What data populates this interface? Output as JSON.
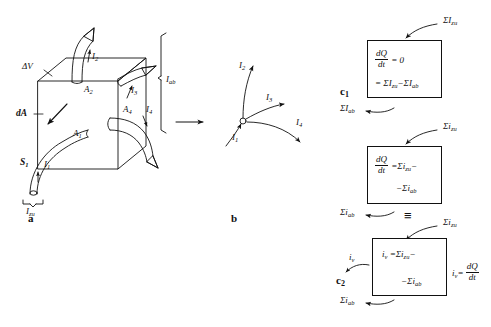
{
  "figure": {
    "parts": [
      {
        "key": "a",
        "label": "a"
      },
      {
        "key": "b",
        "label": "b"
      },
      {
        "key": "c1",
        "label": "c",
        "sub": "1"
      },
      {
        "key": "c2",
        "label": "c",
        "sub": "2"
      }
    ]
  },
  "part_a": {
    "volume_label": {
      "text": "ΔV"
    },
    "area_element_label": {
      "text": "dA"
    },
    "surface_label": {
      "base": "S",
      "sub": "1"
    },
    "areas": [
      {
        "base": "A",
        "sub": "1"
      },
      {
        "base": "A",
        "sub": "2"
      },
      {
        "base": "A",
        "sub": "4"
      }
    ],
    "currents": [
      {
        "base": "I",
        "sub": "1",
        "direction": "in"
      },
      {
        "base": "I",
        "sub": "2",
        "direction": "out"
      },
      {
        "base": "I",
        "sub": "3",
        "direction": "out"
      },
      {
        "base": "I",
        "sub": "4",
        "direction": "out"
      }
    ],
    "brackets": [
      {
        "base": "I",
        "sub": "ab",
        "orientation": "vertical-right"
      },
      {
        "base": "I",
        "sub": "zu",
        "orientation": "horizontal-bottom"
      }
    ]
  },
  "part_b": {
    "node_currents": [
      {
        "base": "I",
        "sub": "1",
        "direction": "in"
      },
      {
        "base": "I",
        "sub": "2",
        "direction": "out"
      },
      {
        "base": "I",
        "sub": "3",
        "direction": "out"
      },
      {
        "base": "I",
        "sub": "4",
        "direction": "out"
      }
    ],
    "transition_arrow": "→"
  },
  "part_c1": {
    "caption": {
      "base": "c",
      "sub": "1"
    },
    "inflow_arrow_label": {
      "sigma": "Σ",
      "base": "I",
      "sub": "zu"
    },
    "outflow_arrow_label": {
      "sigma": "Σ",
      "base": "I",
      "sub": "ab"
    },
    "equation_line1": {
      "frac_num": "dQ",
      "frac_den": "dt",
      "rhs": "= 0"
    },
    "equation_line2": {
      "text": "= ΣI zu − ΣI ab",
      "parts": [
        {
          "op": "="
        },
        {
          "sigma": "Σ",
          "base": "I",
          "sub": "zu"
        },
        {
          "op": "−"
        },
        {
          "sigma": "Σ",
          "base": "I",
          "sub": "ab"
        }
      ]
    }
  },
  "part_c_middle": {
    "inflow_arrow_label": {
      "sigma": "Σ",
      "base": "i",
      "sub": "zu"
    },
    "outflow_arrow_label": {
      "sigma": "Σ",
      "base": "i",
      "sub": "ab"
    },
    "equation_line1": {
      "frac_num": "dQ",
      "frac_den": "dt",
      "rhs_op": "=",
      "sigma": "Σ",
      "base": "i",
      "sub": "zu",
      "trailing": "−"
    },
    "equation_line2": {
      "op": "−",
      "sigma": "Σ",
      "base": "i",
      "sub": "ab"
    }
  },
  "part_c2": {
    "caption": {
      "base": "c",
      "sub": "2"
    },
    "identity_symbol": "≡",
    "inflow_arrow_label": {
      "sigma": "Σ",
      "base": "i",
      "sub": "zu"
    },
    "outflow_arrow_label": {
      "sigma": "Σ",
      "base": "i",
      "sub": "ab"
    },
    "side_current_label": {
      "base": "i",
      "sub": "v"
    },
    "right_equation": {
      "base": "i",
      "sub": "v",
      "op": "=",
      "frac_num": "dQ",
      "frac_den": "dt"
    },
    "equation_line1": {
      "base": "i",
      "sub": "v",
      "op": "=",
      "sigma": "Σ",
      "base2": "i",
      "sub2": "zu",
      "trailing": "−"
    },
    "equation_line2": {
      "op": "−",
      "sigma": "Σ",
      "base": "i",
      "sub": "ab"
    }
  },
  "colors": {
    "ink": "#111111",
    "background": "#ffffff"
  }
}
